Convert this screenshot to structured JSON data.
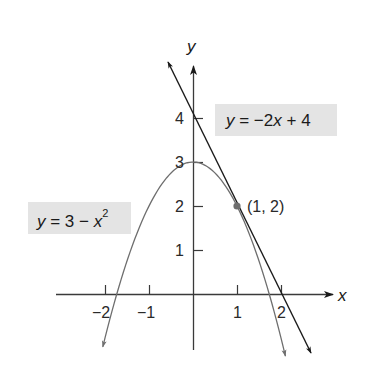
{
  "chart_data": {
    "type": "line",
    "title": "",
    "xlabel": "x",
    "ylabel": "y",
    "xlim": [
      -2.9,
      3.2
    ],
    "ylim": [
      -1.3,
      5.2
    ],
    "grid": false,
    "x_ticks": [
      -2,
      -1,
      1,
      2
    ],
    "x_tick_labels": [
      "−2",
      "−1",
      "1",
      "2"
    ],
    "y_ticks": [
      1,
      2,
      3,
      4
    ],
    "y_tick_labels": [
      "1",
      "2",
      "3",
      "4"
    ],
    "series": [
      {
        "name": "y = 3 − x²",
        "kind": "parabola",
        "equation": "y = 3 - x^2",
        "color": "#6e6e6e",
        "x_range": [
          -2.05,
          2.1
        ],
        "points": [
          [
            -2,
            -1
          ],
          [
            -1,
            2
          ],
          [
            0,
            3
          ],
          [
            1,
            2
          ],
          [
            2,
            -1
          ]
        ]
      },
      {
        "name": "y = −2x + 4",
        "kind": "tangent-line",
        "equation": "y = -2x + 4",
        "color": "#1a1a1a",
        "x_range": [
          -0.57,
          2.68
        ],
        "points": [
          [
            0,
            4
          ],
          [
            1,
            2
          ],
          [
            2,
            0
          ]
        ]
      }
    ],
    "annotations": [
      {
        "type": "point",
        "x": 1,
        "y": 2,
        "label": "(1, 2)",
        "color": "#6e6e6e"
      }
    ],
    "legend": [
      {
        "label": "y = −2x + 4",
        "position": "upper-right"
      },
      {
        "label": "y = 3 − x²",
        "position": "left"
      }
    ]
  },
  "labels": {
    "line_eq": {
      "y": "y",
      "rest": " = −2",
      "x": "x",
      "tail": " + 4"
    },
    "parabola_eq": {
      "y": "y",
      "rest": " = 3 − ",
      "x": "x",
      "sup": "2"
    },
    "point": "(1, 2)",
    "x_axis": "x",
    "y_axis": "y",
    "x_ticks": [
      "−2",
      "−1",
      "1",
      "2"
    ],
    "y_ticks": [
      "1",
      "2",
      "3",
      "4"
    ]
  }
}
